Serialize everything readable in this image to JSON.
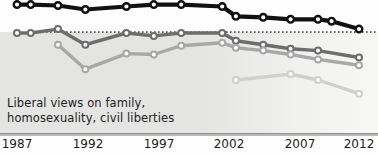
{
  "chart_data": {
    "type": "line",
    "title": "",
    "subtitle": "",
    "xlabel": "",
    "ylabel": "",
    "grid": false,
    "legend_position": "none",
    "annotation": {
      "line1": "Liberal views on family,",
      "line2": "homosexuality, civil liberties"
    },
    "xlim": [
      1987,
      2012
    ],
    "x_ticks": [
      "1987",
      "1992",
      "1997",
      "2002",
      "2007",
      "2012"
    ],
    "x_tick_values": [
      1987,
      1992,
      1997,
      2002,
      2007,
      2012
    ],
    "reference_line": {
      "style": "dotted",
      "value": 100,
      "color": "#3a3a3a",
      "x_start": 1988,
      "x_end": 2012
    },
    "shaded_band": {
      "from": 0,
      "to": 100,
      "color": "#e4e4e2"
    },
    "ylim": [
      0,
      130
    ],
    "series": [
      {
        "name": "black-series",
        "color": "#111111",
        "marker": "circle-open",
        "x": [
          1987,
          1988,
          1990,
          1992,
          1995,
          1997,
          1999,
          2002,
          2003,
          2005,
          2007,
          2009,
          2010,
          2012
        ],
        "values": [
          128,
          128,
          127,
          123,
          126,
          128,
          128,
          126,
          116,
          115,
          113,
          113,
          111,
          103
        ]
      },
      {
        "name": "dark-gray-series",
        "color": "#6d6d6d",
        "marker": "circle-open",
        "x": [
          1987,
          1988,
          1990,
          1992,
          1995,
          1997,
          1999,
          2002,
          2003,
          2005,
          2007,
          2009,
          2012
        ],
        "values": [
          99,
          99,
          103,
          87,
          99,
          96,
          99,
          99,
          91,
          87,
          83,
          81,
          74
        ]
      },
      {
        "name": "medium-gray-series",
        "color": "#a8a8a8",
        "marker": "circle-open",
        "x": [
          1990,
          1992,
          1995,
          1997,
          1999,
          2002,
          2003,
          2005,
          2007,
          2009,
          2012
        ],
        "values": [
          87,
          62,
          78,
          77,
          86,
          89,
          84,
          81,
          77,
          72,
          66
        ]
      },
      {
        "name": "light-gray-series",
        "color": "#cfcfcf",
        "marker": "circle-open",
        "x": [
          2003,
          2007,
          2009,
          2012
        ],
        "values": [
          51,
          57,
          51,
          37
        ]
      }
    ]
  },
  "axis": {
    "ticks": [
      {
        "label": "1987",
        "x_px": 17
      },
      {
        "label": "1992",
        "x_px": 88
      },
      {
        "label": "1997",
        "x_px": 159
      },
      {
        "label": "2002",
        "x_px": 229
      },
      {
        "label": "2007",
        "x_px": 300
      },
      {
        "label": "2012",
        "x_px": 359
      }
    ]
  }
}
